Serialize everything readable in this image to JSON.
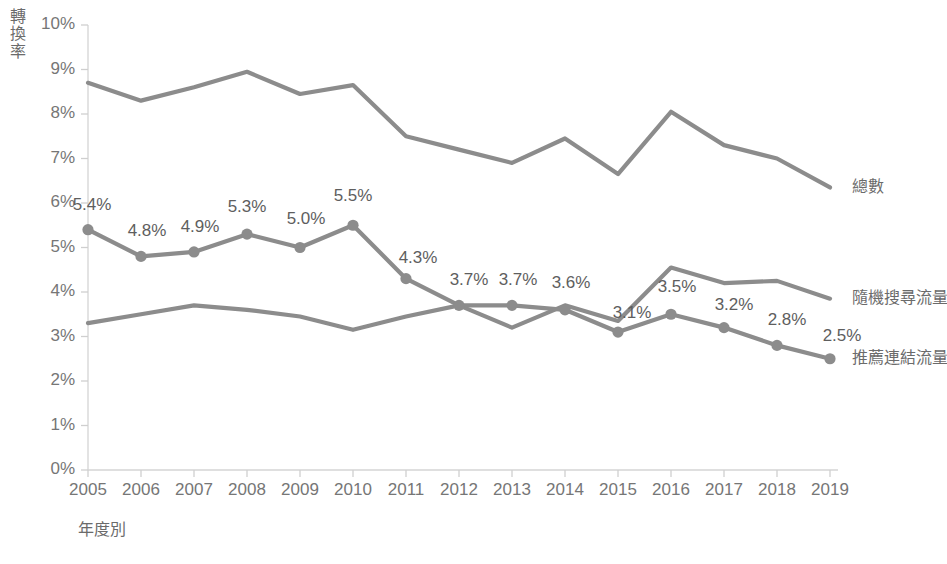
{
  "chart_data": {
    "type": "line",
    "title": "",
    "xlabel": "年度別",
    "ylabel": "轉換率",
    "categories": [
      "2005",
      "2006",
      "2007",
      "2008",
      "2009",
      "2010",
      "2011",
      "2012",
      "2013",
      "2014",
      "2015",
      "2016",
      "2017",
      "2018",
      "2019"
    ],
    "ylim": [
      0,
      10
    ],
    "ytick_labels": [
      "0%",
      "1%",
      "2%",
      "3%",
      "4%",
      "5%",
      "6%",
      "7%",
      "8%",
      "9%",
      "10%"
    ],
    "ytick_values": [
      0,
      1,
      2,
      3,
      4,
      5,
      6,
      7,
      8,
      9,
      10
    ],
    "grid": false,
    "legend_position": "right-inline",
    "series": [
      {
        "name": "總數",
        "values": [
          8.7,
          8.3,
          8.6,
          8.95,
          8.45,
          8.65,
          7.5,
          7.2,
          6.9,
          7.45,
          6.65,
          8.05,
          7.3,
          7.0,
          6.35
        ],
        "color": "#8c8c8c",
        "markers": false,
        "labels": []
      },
      {
        "name": "隨機搜尋流量",
        "values": [
          3.3,
          3.5,
          3.7,
          3.6,
          3.45,
          3.15,
          3.45,
          3.7,
          3.2,
          3.7,
          3.35,
          4.55,
          4.2,
          4.25,
          3.85
        ],
        "color": "#8c8c8c",
        "markers": false,
        "labels": []
      },
      {
        "name": "推薦連結流量",
        "values": [
          5.4,
          4.8,
          4.9,
          5.3,
          5.0,
          5.5,
          4.3,
          3.7,
          3.7,
          3.6,
          3.1,
          3.5,
          3.2,
          2.8,
          2.5
        ],
        "color": "#8c8c8c",
        "markers": true,
        "labels": [
          "5.4%",
          "4.8%",
          "4.9%",
          "5.3%",
          "5.0%",
          "5.5%",
          "4.3%",
          "3.7%",
          "3.7%",
          "3.6%",
          "3.1%",
          "3.5%",
          "3.2%",
          "2.8%",
          "2.5%"
        ]
      }
    ],
    "axis_color": "#d4d4d4",
    "text_color": "#6b6b6b"
  }
}
